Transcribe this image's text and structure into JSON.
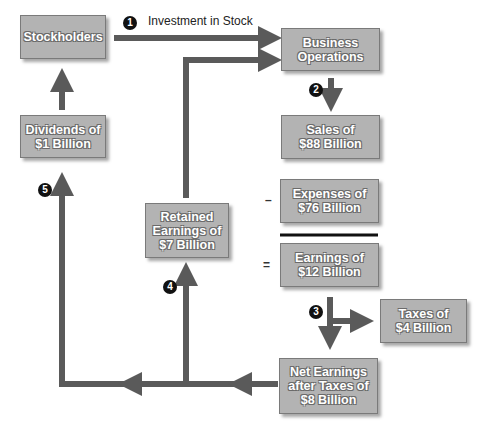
{
  "boxes": {
    "stockholders": "Stockholders",
    "business_operations": "Business\nOperations",
    "sales": "Sales of\n$88 Billion",
    "expenses": "Expenses of\n$76 Billion",
    "earnings": "Earnings of\n$12 Billion",
    "taxes": "Taxes of\n$4 Billion",
    "net_earnings": "Net Earnings\nafter Taxes of\n$8 Billion",
    "retained_earnings": "Retained\nEarnings of\n$7 Billion",
    "dividends": "Dividends of\n$1 Billion"
  },
  "labels": {
    "investment": "Investment in Stock"
  },
  "steps": [
    "1",
    "2",
    "3",
    "4",
    "5"
  ],
  "operators": {
    "minus": "–",
    "equals": "="
  },
  "colors": {
    "box_fill": "#b3b3b3",
    "arrow": "#5a5a5a",
    "badge": "#111111"
  }
}
